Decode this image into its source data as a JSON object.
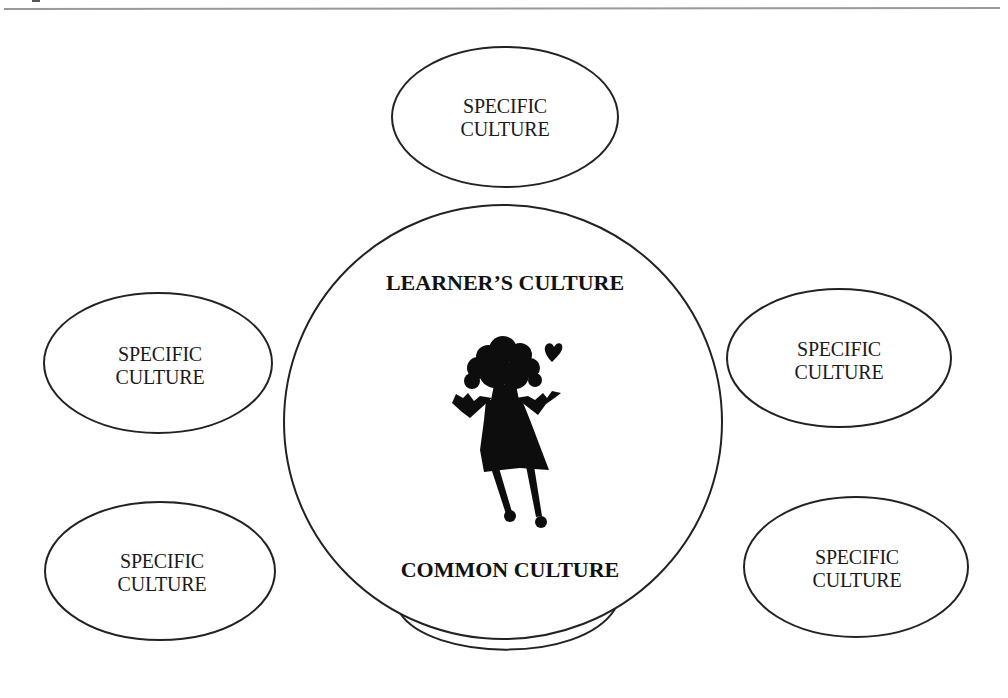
{
  "diagram": {
    "center_circle": {
      "top_label": "LEARNER’S CULTURE",
      "bottom_label": "COMMON CULTURE",
      "figure": "girl-silhouette-with-heart"
    },
    "satellites": [
      {
        "position": "top",
        "line1": "SPECIFIC",
        "line2": "CULTURE"
      },
      {
        "position": "left-upper",
        "line1": "SPECIFIC",
        "line2": "CULTURE"
      },
      {
        "position": "left-lower",
        "line1": "SPECIFIC",
        "line2": "CULTURE"
      },
      {
        "position": "right-upper",
        "line1": "SPECIFIC",
        "line2": "CULTURE"
      },
      {
        "position": "right-lower",
        "line1": "SPECIFIC",
        "line2": "CULTURE"
      }
    ],
    "colors": {
      "stroke": "#222222",
      "rule": "#9a9a9a",
      "figure": "#0d0d0d",
      "background": "#ffffff"
    }
  }
}
